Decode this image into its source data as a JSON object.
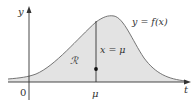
{
  "figure": {
    "y_axis_label": "y",
    "x_axis_label": "t",
    "origin_label": "0",
    "mu_label": "μ",
    "curve_label": "y = f(x)",
    "line_label": "x = μ",
    "region_label": "ℛ"
  },
  "colors": {
    "fill": "#e3e3e3",
    "stroke": "#555555",
    "axis": "#333333",
    "dot": "#111111"
  }
}
